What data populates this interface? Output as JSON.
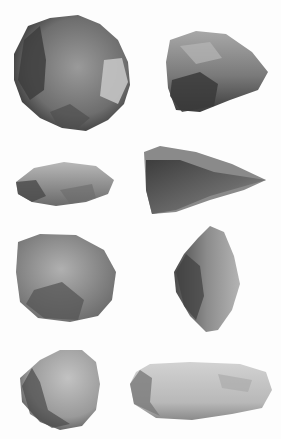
{
  "image": {
    "subject": "photographic plate of stone tools",
    "background_color": "#ffffff",
    "artifacts": [
      {
        "id": "artifact-1",
        "description": "large flaked core, dark grey",
        "position": "top-left"
      },
      {
        "id": "artifact-2",
        "description": "triangular flaked piece, mottled grey",
        "position": "top-right"
      },
      {
        "id": "artifact-3",
        "description": "elongated oval flake",
        "position": "row2-left"
      },
      {
        "id": "artifact-4",
        "description": "pointed triangular flake",
        "position": "row2-right"
      },
      {
        "id": "artifact-5",
        "description": "squarish flaked scraper",
        "position": "row3-left"
      },
      {
        "id": "artifact-6",
        "description": "diagonal leaf-shaped flake",
        "position": "row3-right"
      },
      {
        "id": "artifact-7",
        "description": "rounded hammerstone",
        "position": "bottom-left"
      },
      {
        "id": "artifact-8",
        "description": "long blade fragment, light grey",
        "position": "bottom-right"
      }
    ]
  }
}
